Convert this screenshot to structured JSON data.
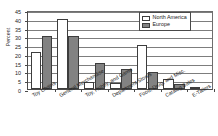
{
  "chart_data": {
    "type": "bar",
    "title": "",
    "xlabel": "",
    "ylabel": "Percent",
    "ylim": [
      0,
      45
    ],
    "ytick_step": 5,
    "yticks": [
      45,
      40,
      35,
      30,
      25,
      20,
      15,
      10,
      5,
      0
    ],
    "grid": true,
    "legend_position": "top-right",
    "categories": [
      "Toy Chains",
      "General Merchandise",
      "Toy, Hobby, and Game",
      "Department Stores",
      "Food, Drug, and Misc.",
      "Catalog Sales",
      "E-Tailers"
    ],
    "series": [
      {
        "name": "North America",
        "color": "#ffffff",
        "values": [
          21,
          40,
          4,
          3.5,
          25,
          5.5,
          1
        ]
      },
      {
        "name": "Europe",
        "color": "#828282",
        "values": [
          30,
          30,
          15,
          11.5,
          9.5,
          3,
          0
        ]
      }
    ]
  },
  "legend": {
    "items": [
      {
        "label": "North America"
      },
      {
        "label": "Europe"
      }
    ]
  }
}
